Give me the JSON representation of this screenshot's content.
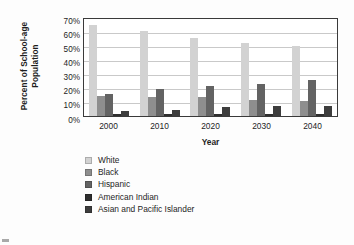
{
  "chart_data": {
    "type": "bar",
    "title": "",
    "xlabel": "Year",
    "ylabel": "Percent of School-age Population",
    "categories": [
      "2000",
      "2010",
      "2020",
      "2030",
      "2040"
    ],
    "ylim": [
      0,
      70
    ],
    "ytick_step": 10,
    "ytick_labels": [
      "70%",
      "60%",
      "50%",
      "40%",
      "30%",
      "20%",
      "10%",
      "0%"
    ],
    "ytick_values": [
      70,
      60,
      50,
      40,
      30,
      20,
      10,
      0
    ],
    "grid": true,
    "legend_position": "below",
    "value_unit": "%",
    "series": [
      {
        "name": "White",
        "color": "#d2d2d2",
        "values": [
          64,
          60,
          55,
          51,
          49
        ]
      },
      {
        "name": "Black",
        "color": "#8e8e8e",
        "values": [
          14,
          13,
          13,
          11,
          10
        ]
      },
      {
        "name": "Hispanic",
        "color": "#636363",
        "values": [
          15,
          19,
          21,
          22,
          25
        ]
      },
      {
        "name": "American Indian",
        "color": "#2e2e2e",
        "values": [
          1,
          1,
          1,
          1,
          1
        ]
      },
      {
        "name": "Asian and Pacific Islander",
        "color": "#3d3d3d",
        "values": [
          3,
          4,
          6,
          6.5,
          7
        ]
      }
    ]
  },
  "axis": {
    "y_title_line1": "Percent of School-age",
    "y_title_line2": "Population",
    "x_title": "Year"
  }
}
